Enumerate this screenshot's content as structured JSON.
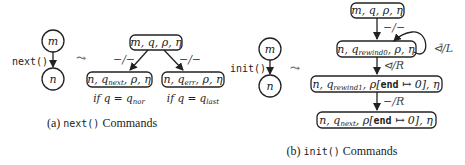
{
  "panel_a": {
    "caption_prefix": "(a) ",
    "caption_code": "next()",
    "caption_suffix": " Commands",
    "source_graph": {
      "top_node": "m",
      "bottom_node": "n",
      "edge_label": "next()"
    },
    "leadsto": "⤳",
    "root_box": "m, q, ρ, η",
    "left_edge_label": "−/−",
    "right_edge_label": "−/−",
    "left_box": {
      "pre": "n, q",
      "sub": "next",
      "post": ", ρ, η"
    },
    "right_box": {
      "pre": "n, q",
      "sub": "err",
      "post": ", ρ, η"
    },
    "left_condition": {
      "pre": "if q = q",
      "sub": "nor"
    },
    "right_condition": {
      "pre": "if q = q",
      "sub": "last"
    }
  },
  "panel_b": {
    "caption_prefix": "(b) ",
    "caption_code": "init()",
    "caption_suffix": " Commands",
    "source_graph": {
      "top_node": "m",
      "bottom_node": "n",
      "edge_label": "init()"
    },
    "leadsto": "⤳",
    "box1": "m, q, ρ, η",
    "edge1_label": "−/−",
    "box2": {
      "pre": "n, q",
      "sub": "rewind0",
      "post": ", ρ, η"
    },
    "self_loop_label": "⊲̄/L",
    "edge2_label": "⊲/R",
    "box3": {
      "pre": "n, q",
      "sub": "rewind1",
      "mid": ", ρ[",
      "kw": "end",
      "post": " ↦ 0], η"
    },
    "edge3_label": "−/R",
    "box4": {
      "pre": "n, q",
      "sub": "next",
      "mid": ", ρ[",
      "kw": "end",
      "post": " ↦ 0], η"
    }
  }
}
